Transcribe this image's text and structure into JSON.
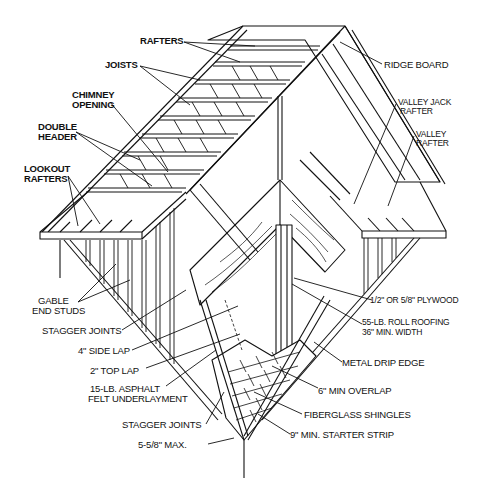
{
  "diagram": {
    "labels": {
      "rafters": "RAFTERS",
      "joists": "JOISTS",
      "chimney_opening_1": "CHIMNEY",
      "chimney_opening_2": "OPENING",
      "double_header_1": "DOUBLE",
      "double_header_2": "HEADER",
      "lookout_rafters_1": "LOOKOUT",
      "lookout_rafters_2": "RAFTERS",
      "ridge_board": "RIDGE BOARD",
      "valley_jack_rafter_1": "VALLEY JACK",
      "valley_jack_rafter_2": "RAFTER",
      "valley_rafter_1": "VALLEY",
      "valley_rafter_2": "RAFTER",
      "gable_end_studs_1": "GABLE",
      "gable_end_studs_2": "END STUDS",
      "stagger_joints_upper": "STAGGER JOINTS",
      "side_lap": "4\" SIDE LAP",
      "top_lap": "2\" TOP LAP",
      "felt_underlayment_1": "15-LB. ASPHALT",
      "felt_underlayment_2": "FELT UNDERLAYMENT",
      "stagger_joints_lower": "STAGGER JOINTS",
      "max_exposure": "5-5/8\" MAX.",
      "plywood": "1/2\" OR 5/8\" PLYWOOD",
      "roll_roofing_1": "55-LB. ROLL ROOFING",
      "roll_roofing_2": "36\" MIN. WIDTH",
      "metal_drip_edge": "METAL DRIP EDGE",
      "min_overlap": "6\" MIN OVERLAP",
      "fiberglass_shingles": "FIBERGLASS  SHINGLES",
      "starter_strip": "9\" MIN. STARTER STRIP"
    },
    "line_color": "#111111",
    "background": "#ffffff"
  }
}
